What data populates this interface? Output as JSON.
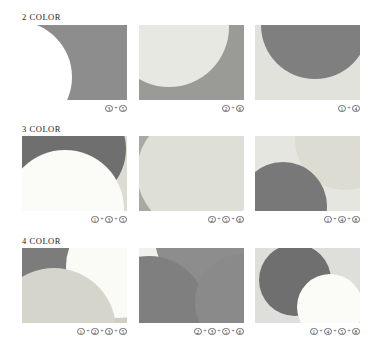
{
  "page": {
    "background": "#ffffff"
  },
  "palette": {
    "white": "#ffffff",
    "offwhite": "#fbfbf8",
    "pale": "#f0f0ea",
    "light": "#e4e4dd",
    "light2": "#dcdcd3",
    "mid_light": "#cfcfc6",
    "mid": "#b9b9ae",
    "gray": "#8f8f8f",
    "dark_gray": "#7d7d7d",
    "dark": "#6f6f6f"
  },
  "rows": [
    {
      "header": "2 COLOR",
      "panels": [
        {
          "name": "panel-2color-1",
          "caption_numbers": [
            "3",
            "5"
          ],
          "background": "#8d8d8d",
          "shapes": [
            {
              "color": "#ffffff",
              "left": -62,
              "top": -4,
              "size": 112
            }
          ]
        },
        {
          "name": "panel-2color-2",
          "caption_numbers": [
            "2",
            "6"
          ],
          "background": "#9a9a96",
          "shapes": [
            {
              "color": "#e8e8e2",
              "left": -30,
              "top": -58,
              "size": 120
            }
          ]
        },
        {
          "name": "panel-2color-3",
          "caption_numbers": [
            "1",
            "4"
          ],
          "background": "#e2e2dc",
          "shapes": [
            {
              "color": "#7f7f7f",
              "left": 6,
              "top": -54,
              "size": 108
            }
          ]
        }
      ]
    },
    {
      "header": "3 COLOR",
      "panels": [
        {
          "name": "panel-3color-1",
          "caption_numbers": [
            "1",
            "3",
            "5"
          ],
          "background": "#dcdcd4",
          "shapes": [
            {
              "color": "#6f6f6f",
              "left": -6,
              "top": -42,
              "size": 110
            },
            {
              "color": "#fbfbf8",
              "left": -16,
              "top": 14,
              "size": 118
            }
          ]
        },
        {
          "name": "panel-3color-2",
          "caption_numbers": [
            "2",
            "5",
            "6"
          ],
          "background": "#f2f2ec",
          "shapes": [
            {
              "color": "#a9a9a2",
              "left": -58,
              "top": -20,
              "size": 104
            },
            {
              "color": "#dedfd6",
              "left": -2,
              "top": -24,
              "size": 120
            }
          ]
        },
        {
          "name": "panel-3color-3",
          "caption_numbers": [
            "1",
            "4",
            "8"
          ],
          "background": "#e6e6e0",
          "shapes": [
            {
              "color": "#dddcd3",
              "left": 40,
              "top": -46,
              "size": 100
            },
            {
              "color": "#787878",
              "left": -16,
              "top": 26,
              "size": 88
            }
          ]
        }
      ]
    },
    {
      "header": "4 COLOR",
      "panels": [
        {
          "name": "panel-4color-1",
          "caption_numbers": [
            "1",
            "2",
            "3",
            "5"
          ],
          "background": "#cfcfc6",
          "shapes": [
            {
              "color": "#7c7c7c",
              "left": -44,
              "top": -52,
              "size": 106
            },
            {
              "color": "#fafaf6",
              "left": 44,
              "top": -34,
              "size": 104
            },
            {
              "color": "#d5d5cc",
              "left": -30,
              "top": 20,
              "size": 124
            }
          ]
        },
        {
          "name": "panel-4color-2",
          "caption_numbers": [
            "2",
            "3",
            "5",
            "6"
          ],
          "background": "#f1f1ec",
          "shapes": [
            {
              "color": "#8d8d8d",
              "left": 16,
              "top": -62,
              "size": 104
            },
            {
              "color": "#7f7f7f",
              "left": -48,
              "top": 8,
              "size": 116
            },
            {
              "color": "#8a8a8a",
              "left": 56,
              "top": 6,
              "size": 96
            }
          ]
        },
        {
          "name": "panel-4color-3",
          "caption_numbers": [
            "1",
            "4",
            "5",
            "8"
          ],
          "background": "#dededa",
          "shapes": [
            {
              "color": "#6f6f6f",
              "left": 4,
              "top": -4,
              "size": 72
            },
            {
              "color": "#fbfbf7",
              "left": 42,
              "top": 26,
              "size": 66
            }
          ]
        }
      ]
    }
  ],
  "layout": {
    "panel_width": 105,
    "panel_height": 75,
    "column_x": [
      22,
      139,
      255
    ],
    "row_header_y": [
      12,
      124,
      236
    ],
    "row_panel_y": [
      25,
      136,
      248
    ],
    "row_caption_y": [
      104,
      215,
      327
    ],
    "plus_symbol": "+"
  }
}
